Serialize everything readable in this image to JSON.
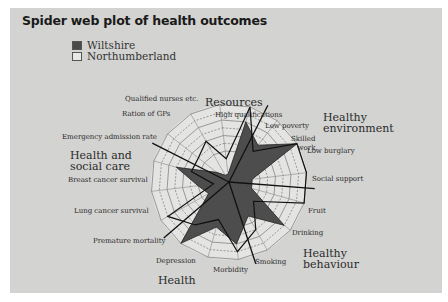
{
  "chart_data": {
    "type": "radar",
    "title": "Spider web plot of health outcomes",
    "legend": [
      {
        "name": "Wiltshire",
        "swatch": "filled-dark",
        "color": "#4a4a4a"
      },
      {
        "name": "Northumberland",
        "swatch": "outline",
        "color": "#000000"
      }
    ],
    "groups": [
      "Resources",
      "Healthy environment",
      "Healthy behaviour",
      "Health",
      "Health and social care"
    ],
    "axes": [
      "High qualifications",
      "Low poverty",
      "Skilled work",
      "Low burglary",
      "Social support",
      "Fruit",
      "Drinking",
      "Smoking",
      "Morbidity",
      "Depression",
      "Premature mortality",
      "Lung cancer survival",
      "Breast cancer survival",
      "Emergency admission rate",
      "Ration of GPs",
      "Qualified nurses etc."
    ],
    "range": [
      0,
      10
    ],
    "grid_rings": 10,
    "series": [
      {
        "name": "Wiltshire",
        "values": [
          1,
          8,
          6,
          10,
          3,
          3,
          9,
          5,
          8,
          6,
          10,
          3,
          4,
          7,
          2,
          1
        ]
      },
      {
        "name": "Northumberland",
        "values": [
          3,
          10,
          5,
          10,
          10,
          10,
          4,
          7,
          9,
          5,
          7,
          9,
          2,
          5,
          5,
          6
        ]
      }
    ]
  },
  "labels": {
    "title": "Spider web plot of health outcomes",
    "legend_1": "Wiltshire",
    "legend_2": "Northumberland",
    "g_resources": "Resources",
    "g_env_1": "Healthy",
    "g_env_2": "environment",
    "g_beh_1": "Healthy",
    "g_beh_2": "behaviour",
    "g_health": "Health",
    "g_hsc_1": "Health and",
    "g_hsc_2": "social care",
    "a_high_qual": "High qualifications",
    "a_low_poverty": "Low poverty",
    "a_skilled_1": "Skilled",
    "a_skilled_2": "work",
    "a_low_burglary": "Low burglary",
    "a_social": "Social support",
    "a_fruit": "Fruit",
    "a_drinking": "Drinking",
    "a_smoking": "Smoking",
    "a_morbidity": "Morbidity",
    "a_depression": "Depression",
    "a_premature": "Premature mortality",
    "a_lung": "Lung cancer survival",
    "a_breast": "Breast cancer survival",
    "a_emergency": "Emergency admission rate",
    "a_gps": "Ration of GPs",
    "a_nurses": "Qualified nurses etc."
  }
}
